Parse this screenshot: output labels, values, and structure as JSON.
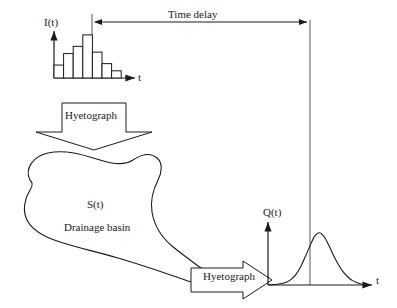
{
  "figure": {
    "background_color": "#ffffff",
    "line_color": "#1a1a1a",
    "bar_fill_color": "#ffffff",
    "width": 397,
    "height": 308
  },
  "labels": {
    "time_delay": "Time delay",
    "intensity_axis": "I(t)",
    "time_axis_hyetograph": "t",
    "hyetograph_down": "Hyetograph",
    "basin_function": "S(t)",
    "basin_name": "Drainage basin",
    "hyetograph_right": "Hyetograph",
    "discharge_axis": "Q(t)",
    "time_axis_hydrograph": "t"
  },
  "chart_data": [
    {
      "type": "bar",
      "name": "hyetograph",
      "title": "",
      "xlabel": "t",
      "ylabel": "I(t)",
      "categories": [
        "1",
        "2",
        "3",
        "4",
        "5",
        "6",
        "7"
      ],
      "values": [
        9,
        17,
        22,
        30,
        18,
        10,
        5
      ],
      "ylim": [
        0,
        32
      ],
      "grid": false,
      "legend": false,
      "peak_category": "4",
      "peak_value": 30
    },
    {
      "type": "line",
      "name": "hydrograph",
      "title": "",
      "xlabel": "t",
      "ylabel": "Q(t)",
      "x": [
        0,
        5,
        10,
        15,
        20,
        25,
        30,
        35,
        40,
        45,
        50,
        55,
        60,
        65,
        70,
        75,
        80,
        85,
        90,
        95,
        100
      ],
      "y": [
        0,
        0.5,
        1,
        2,
        4,
        8,
        15,
        26,
        40,
        55,
        68,
        72,
        66,
        54,
        40,
        28,
        18,
        11,
        6,
        3,
        1
      ],
      "ylim": [
        0,
        80
      ],
      "grid": false,
      "legend": false,
      "peak_x": 55,
      "peak_y": 72
    }
  ],
  "annotations": {
    "time_delay_arrow": {
      "from_x": 92,
      "to_x": 310,
      "y": 22,
      "double_headed": true
    },
    "left_drop_line": {
      "x": 92,
      "from_y": 14,
      "to_y": 78
    },
    "right_drop_line": {
      "x": 310,
      "from_y": 22,
      "to_y": 285
    }
  }
}
